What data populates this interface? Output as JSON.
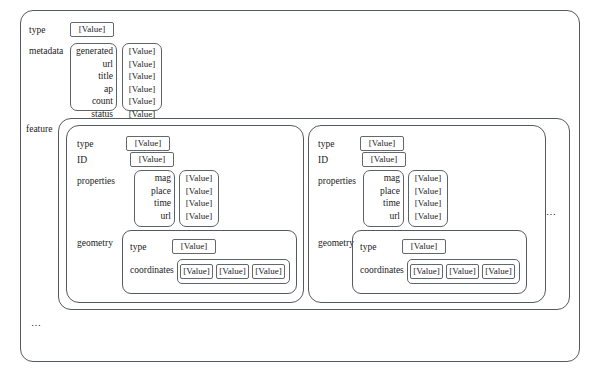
{
  "diagram": {
    "value_placeholder": "[Value]",
    "ellipsis": "…",
    "root": {
      "type_label": "type",
      "type_value": "[Value]",
      "metadata_label": "metadata",
      "metadata_keys": [
        "generated",
        "url",
        "title",
        "ap",
        "count",
        "status"
      ],
      "metadata_values": [
        "[Value]",
        "[Value]",
        "[Value]",
        "[Value]",
        "[Value]",
        "[Value]"
      ],
      "feature_label": "feature",
      "more_features_ellipsis": "…",
      "root_overflow_ellipsis": "…"
    },
    "features": [
      {
        "type_label": "type",
        "type_value": "[Value]",
        "id_label": "ID",
        "id_value": "[Value]",
        "properties_label": "properties",
        "properties_keys": [
          "mag",
          "place",
          "time",
          "url",
          "…"
        ],
        "properties_values": [
          "[Value]",
          "[Value]",
          "[Value]",
          "[Value]",
          "…"
        ],
        "geometry_label": "geometry",
        "geometry_type_label": "type",
        "geometry_type_value": "[Value]",
        "coordinates_label": "coordinates",
        "coordinates_values": [
          "[Value]",
          "[Value]",
          "[Value]"
        ]
      },
      {
        "type_label": "type",
        "type_value": "[Value]",
        "id_label": "ID",
        "id_value": "[Value]",
        "properties_label": "properties",
        "properties_keys": [
          "mag",
          "place",
          "time",
          "url",
          "…"
        ],
        "properties_values": [
          "[Value]",
          "[Value]",
          "[Value]",
          "[Value]",
          "…"
        ],
        "geometry_label": "geometry",
        "geometry_type_label": "type",
        "geometry_type_value": "[Value]",
        "coordinates_label": "coordinates",
        "coordinates_values": [
          "[Value]",
          "[Value]",
          "[Value]"
        ]
      }
    ],
    "colors": {
      "stroke": "#555a5e",
      "text": "#1a1a1a",
      "background": "#ffffff"
    }
  }
}
